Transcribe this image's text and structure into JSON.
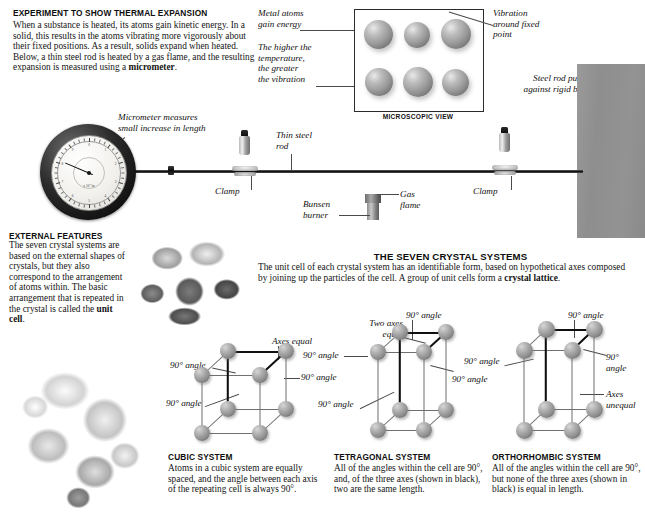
{
  "experiment": {
    "heading": "EXPERIMENT TO SHOW THERMAL EXPANSION",
    "body_html": "When a substance is heated, its atoms gain kinetic energy. In a solid, this results in the atoms vibrating more vigorously about their fixed positions. As a result, solids expand when heated. Below, a thin steel rod is heated by a gas flame, and the resulting expansion is measured using a <b>micrometer</b>.",
    "labels": {
      "metal_atoms": "Metal atoms\ngain energy",
      "higher_temp": "The higher the\ntemperature,\nthe greater\nthe vibration",
      "vibration": "Vibration\naround fixed\npoint",
      "steel_rod_block": "Steel rod pushes\nagainst rigid block",
      "micrometer": "Micrometer measures\nsmall increase in length",
      "thin_steel_rod": "Thin steel\nrod",
      "clamp_left": "Clamp",
      "clamp_right": "Clamp",
      "gas_flame": "Gas\nflame",
      "bunsen_burner": "Bunsen\nburner"
    },
    "microscopic_caption": "MICROSCOPIC VIEW",
    "dial": {
      "scale_label": "x 10-6m",
      "numbers": [
        "0",
        "1",
        "2",
        "3",
        "4",
        "5",
        "6",
        "7",
        "8",
        "9"
      ],
      "needle_angle_deg": 203
    }
  },
  "external_features": {
    "heading": "EXTERNAL FEATURES",
    "body_html": "The seven crystal systems are based on the external shapes of crystals, but they also correspond to the arrangement of atoms within. The basic arrangement that is repeated in the crystal is called the <b>unit cell</b>."
  },
  "crystal_systems": {
    "heading": "THE SEVEN CRYSTAL SYSTEMS",
    "intro_html": "The unit cell of each crystal system has an identifiable form, based on hypothetical axes composed by joining up the particles of the cell. A group of unit cells form a <b>crystal lattice</b>.",
    "cubic": {
      "title": "CUBIC SYSTEM",
      "body": "Atoms in a cubic system are equally spaced, and the angle between each axis of the repeating cell is always 90°.",
      "annotations": {
        "axes_equal": "Axes equal",
        "angle_top_left": "90° angle",
        "angle_right": "90° angle",
        "angle_bottom_left": "90° angle"
      }
    },
    "tetragonal": {
      "title": "TETRAGONAL SYSTEM",
      "body": "All of the angles within the cell are 90°, and, of the three axes (shown in black), two are the same length.",
      "annotations": {
        "two_axes_equal": "Two axes\nequal",
        "angle_top": "90° angle",
        "angle_left_upper": "90° angle",
        "angle_left_lower": "90° angle",
        "angle_right": "90° angle"
      }
    },
    "orthorhombic": {
      "title": "ORTHORHOMBIC SYSTEM",
      "body": "All of the angles within the cell are 90°, but none of the three axes (shown in black) is equal in length.",
      "annotations": {
        "angle_top": "90° angle",
        "angle_left": "90° angle",
        "angle_right": "90°\nangle",
        "axes_unequal": "Axes\nunequal"
      }
    }
  },
  "colors": {
    "page_bg": "#ffffff",
    "text": "#121212",
    "sphere_gray": "#8f8f8f",
    "dark_edge": "#101010",
    "light_edge": "#6f6f6f",
    "block_gray": "#919191"
  }
}
